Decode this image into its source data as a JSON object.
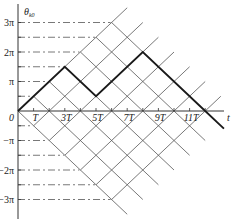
{
  "diagram": {
    "y_axis_label": "θ",
    "y_axis_subscript": "k0",
    "x_axis_label": "t",
    "origin_label": "0",
    "x_ticks": [
      {
        "label": "T",
        "t": 1
      },
      {
        "label": "3T",
        "t": 3
      },
      {
        "label": "5T",
        "t": 5
      },
      {
        "label": "7T",
        "t": 7
      },
      {
        "label": "9T",
        "t": 9
      },
      {
        "label": "11T",
        "t": 11
      }
    ],
    "y_ticks": [
      {
        "label": "3π",
        "v": 3
      },
      {
        "label": "2π",
        "v": 2
      },
      {
        "label": "π",
        "v": 1
      },
      {
        "label": "−π",
        "v": -1
      },
      {
        "label": "−2π",
        "v": -2
      },
      {
        "label": "−3π",
        "v": -3
      }
    ],
    "bold_path": [
      [
        0,
        0
      ],
      [
        3,
        1.5
      ],
      [
        5,
        0.5
      ],
      [
        8,
        2
      ],
      [
        12,
        0
      ]
    ],
    "colors": {
      "line": "#555555",
      "bold": "#1a1a1a",
      "axis": "#333333"
    }
  }
}
